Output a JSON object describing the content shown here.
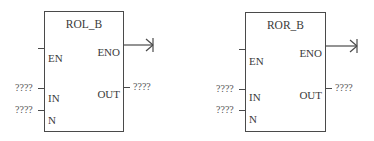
{
  "blocks": [
    {
      "title": "ROL_B",
      "inputs": {
        "en": "EN",
        "in": "IN",
        "n": "N"
      },
      "outputs": {
        "eno": "ENO",
        "out": "OUT"
      },
      "params": {
        "in_value": "????",
        "n_value": "????",
        "out_value": "????"
      }
    },
    {
      "title": "ROR_B",
      "inputs": {
        "en": "EN",
        "in": "IN",
        "n": "N"
      },
      "outputs": {
        "eno": "ENO",
        "out": "OUT"
      },
      "params": {
        "in_value": "????",
        "n_value": "????",
        "out_value": "????"
      }
    }
  ]
}
